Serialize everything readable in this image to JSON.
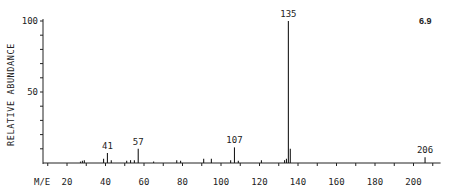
{
  "chart_data": {
    "type": "bar",
    "title": "",
    "figure_label": "6.9",
    "xlabel": "M/E",
    "ylabel": "RELATIVE ABUNDANCE",
    "xlim": [
      10,
      212
    ],
    "ylim": [
      0,
      100
    ],
    "x_ticks": [
      20,
      40,
      60,
      80,
      100,
      120,
      140,
      160,
      180,
      200
    ],
    "y_ticks": [
      50,
      100
    ],
    "grid": false,
    "legend": null,
    "labeled_peaks": [
      41,
      57,
      107,
      135,
      206
    ],
    "peaks": [
      {
        "mz": 27,
        "intensity": 1
      },
      {
        "mz": 28,
        "intensity": 1.5
      },
      {
        "mz": 29,
        "intensity": 2
      },
      {
        "mz": 39,
        "intensity": 3
      },
      {
        "mz": 41,
        "intensity": 7
      },
      {
        "mz": 43,
        "intensity": 2
      },
      {
        "mz": 51,
        "intensity": 1.5
      },
      {
        "mz": 53,
        "intensity": 2
      },
      {
        "mz": 55,
        "intensity": 2
      },
      {
        "mz": 57,
        "intensity": 10
      },
      {
        "mz": 65,
        "intensity": 1
      },
      {
        "mz": 77,
        "intensity": 2
      },
      {
        "mz": 79,
        "intensity": 1.5
      },
      {
        "mz": 91,
        "intensity": 3
      },
      {
        "mz": 95,
        "intensity": 3
      },
      {
        "mz": 105,
        "intensity": 2
      },
      {
        "mz": 107,
        "intensity": 11
      },
      {
        "mz": 109,
        "intensity": 1.5
      },
      {
        "mz": 121,
        "intensity": 2
      },
      {
        "mz": 133,
        "intensity": 2
      },
      {
        "mz": 134,
        "intensity": 3
      },
      {
        "mz": 135,
        "intensity": 100
      },
      {
        "mz": 136,
        "intensity": 10
      },
      {
        "mz": 206,
        "intensity": 4
      }
    ]
  },
  "labels": {
    "x_axis": "M/E",
    "y_axis": "RELATIVE ABUNDANCE",
    "figure": "6.9"
  }
}
